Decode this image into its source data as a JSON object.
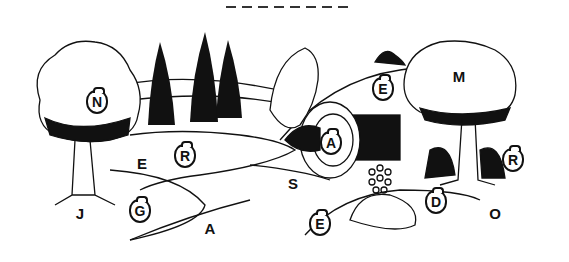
{
  "puzzle": {
    "answer_blanks": 8,
    "plain_letters": [
      {
        "char": "E",
        "x": 142,
        "y": 163
      },
      {
        "char": "J",
        "x": 80,
        "y": 213
      },
      {
        "char": "A",
        "x": 210,
        "y": 228
      },
      {
        "char": "S",
        "x": 293,
        "y": 183
      },
      {
        "char": "M",
        "x": 459,
        "y": 76
      },
      {
        "char": "O",
        "x": 495,
        "y": 213
      }
    ],
    "bag_letters": [
      {
        "char": "N",
        "x": 97,
        "y": 102
      },
      {
        "char": "R",
        "x": 185,
        "y": 156
      },
      {
        "char": "G",
        "x": 140,
        "y": 211
      },
      {
        "char": "A",
        "x": 331,
        "y": 143
      },
      {
        "char": "E",
        "x": 383,
        "y": 89
      },
      {
        "char": "R",
        "x": 513,
        "y": 160
      },
      {
        "char": "D",
        "x": 436,
        "y": 202
      },
      {
        "char": "E",
        "x": 320,
        "y": 224
      }
    ]
  },
  "scene": {
    "description": "Line-art garden tomb scene with rolled stone, trees, cypresses, path",
    "ink_color": "#111111",
    "paper_color": "#ffffff"
  }
}
